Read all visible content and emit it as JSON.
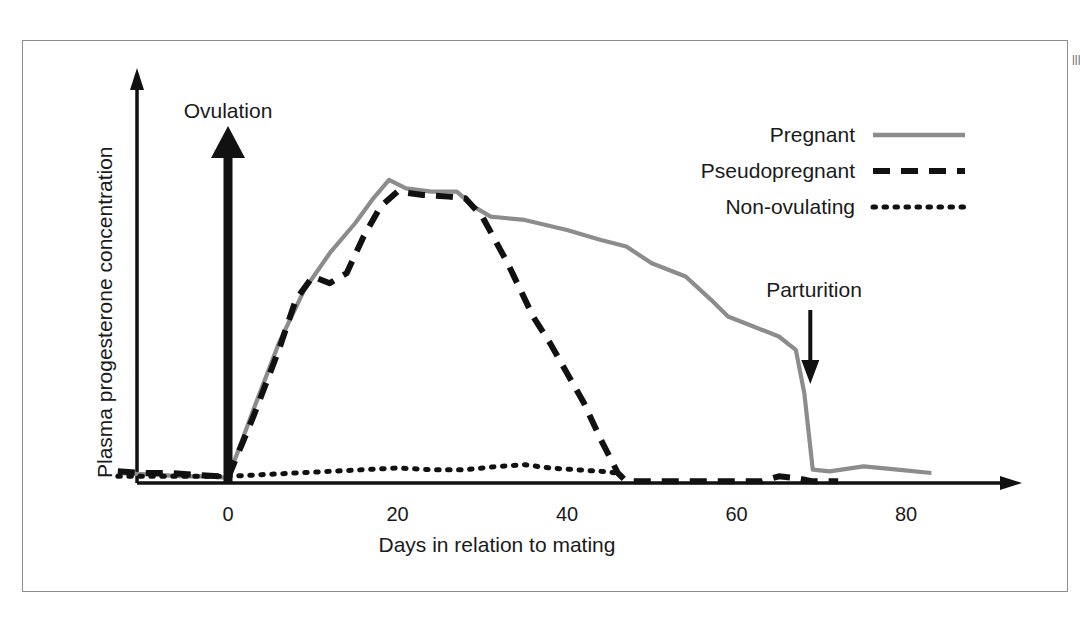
{
  "page": {
    "edge_text": "|||"
  },
  "chart_data": {
    "type": "line",
    "title": "",
    "xlabel": "Days in relation to mating",
    "ylabel": "Plasma progesterone concentration",
    "xlim": [
      -13,
      89
    ],
    "ylim": [
      0,
      1.05
    ],
    "xticks": [
      0,
      20,
      40,
      60,
      80
    ],
    "xtick_labels": [
      "0",
      "20",
      "40",
      "60",
      "80"
    ],
    "yticks": [],
    "ytick_labels": [],
    "grid": false,
    "legend_position": "top-right",
    "axis_style": "arrow-headed L axes, no y tick marks, qualitative y scale",
    "series": [
      {
        "name": "Pregnant",
        "style": "solid",
        "color": "#8c8c8c",
        "x": [
          -13,
          -9,
          -5,
          -2,
          0,
          3,
          6,
          9,
          12,
          15,
          17,
          19,
          21,
          24,
          27,
          29,
          31,
          35,
          40,
          44,
          47,
          50,
          54,
          57,
          59,
          62,
          65,
          67,
          68,
          69,
          71,
          75,
          79,
          83
        ],
        "y": [
          0.03,
          0.025,
          0.02,
          0.02,
          0.015,
          0.22,
          0.42,
          0.58,
          0.69,
          0.78,
          0.85,
          0.91,
          0.885,
          0.875,
          0.875,
          0.83,
          0.8,
          0.79,
          0.76,
          0.73,
          0.71,
          0.66,
          0.62,
          0.55,
          0.5,
          0.47,
          0.44,
          0.4,
          0.27,
          0.04,
          0.035,
          0.05,
          0.04,
          0.03
        ]
      },
      {
        "name": "Pseudopregnant",
        "style": "dashed",
        "color": "#111111",
        "x": [
          -13,
          -10,
          -7,
          -4,
          -1,
          0,
          3,
          6,
          8,
          10,
          12,
          14,
          16,
          18,
          20,
          23,
          26,
          28,
          30,
          33,
          36,
          38,
          40,
          42,
          44,
          46,
          47,
          50,
          55,
          60,
          63,
          65,
          67,
          69,
          72
        ],
        "y": [
          0.035,
          0.03,
          0.03,
          0.025,
          0.02,
          0.015,
          0.2,
          0.4,
          0.55,
          0.62,
          0.6,
          0.63,
          0.74,
          0.83,
          0.875,
          0.865,
          0.86,
          0.855,
          0.8,
          0.66,
          0.5,
          0.42,
          0.33,
          0.24,
          0.13,
          0.03,
          0.005,
          0.005,
          0.005,
          0.005,
          0.005,
          0.02,
          0.015,
          0.005,
          0.005
        ]
      },
      {
        "name": "Non-ovulating",
        "style": "dotted",
        "color": "#111111",
        "x": [
          -13,
          -8,
          -4,
          0,
          4,
          8,
          12,
          16,
          20,
          24,
          28,
          32,
          35,
          38,
          41,
          44,
          46
        ],
        "y": [
          0.02,
          0.02,
          0.02,
          0.02,
          0.025,
          0.03,
          0.035,
          0.04,
          0.045,
          0.04,
          0.04,
          0.05,
          0.055,
          0.045,
          0.04,
          0.035,
          0.03
        ]
      }
    ],
    "annotations": [
      {
        "label": "Ovulation",
        "x": 0,
        "direction": "up",
        "style": "thick-arrow",
        "description": "Thick black arrow pointing up at day 0"
      },
      {
        "label": "Parturition",
        "x": 68,
        "direction": "down",
        "style": "thin-arrow",
        "description": "Thin black arrow pointing down at day 68"
      }
    ]
  }
}
